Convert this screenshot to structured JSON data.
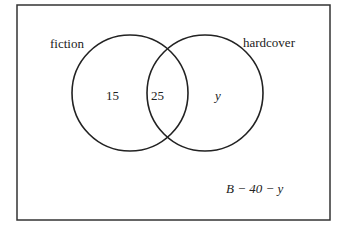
{
  "diagram": {
    "type": "venn",
    "sets": [
      {
        "name": "fiction",
        "only_value": "15"
      },
      {
        "name": "hardcover",
        "only_value": "y"
      }
    ],
    "intersection_value": "25",
    "outside_value": "B − 40 − y",
    "colors": {
      "stroke": "#222222",
      "background": "#ffffff"
    }
  }
}
